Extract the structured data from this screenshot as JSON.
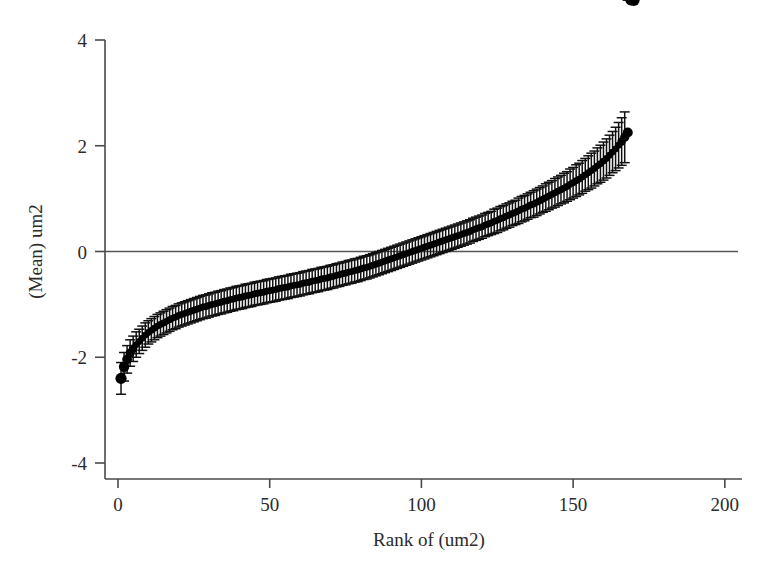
{
  "chart_data": {
    "type": "scatter",
    "title": "",
    "subtitle": "",
    "xlabel": "Rank of (um2)",
    "ylabel": "(Mean) um2",
    "xlim": [
      0,
      205
    ],
    "ylim": [
      -4,
      4
    ],
    "xticks": [
      0,
      50,
      100,
      150,
      200
    ],
    "xtick_labels": [
      "0",
      "50",
      "100",
      "150",
      "200"
    ],
    "yticks": [
      -4,
      -2,
      0,
      2,
      4
    ],
    "ytick_labels": [
      "-4",
      "-2",
      "0",
      "2",
      "4"
    ],
    "grid": false,
    "legend": null,
    "legend_position": "none",
    "reference_lines": [
      {
        "orientation": "horizontal",
        "value": 0,
        "style": "solid",
        "color": "#555555"
      }
    ],
    "marker_style": "filled-circle",
    "marker_color": "#000000",
    "error_bar_style": "capped-vertical",
    "error_bar_color": "#111111",
    "n_points": 170,
    "x": [
      1,
      2,
      3,
      4,
      5,
      6,
      7,
      8,
      9,
      10,
      11,
      12,
      13,
      14,
      15,
      16,
      17,
      18,
      19,
      20,
      21,
      22,
      23,
      24,
      25,
      26,
      27,
      28,
      29,
      30,
      31,
      32,
      33,
      34,
      35,
      36,
      37,
      38,
      39,
      40,
      41,
      42,
      43,
      44,
      45,
      46,
      47,
      48,
      49,
      50,
      51,
      52,
      53,
      54,
      55,
      56,
      57,
      58,
      59,
      60,
      61,
      62,
      63,
      64,
      65,
      66,
      67,
      68,
      69,
      70,
      71,
      72,
      73,
      74,
      75,
      76,
      77,
      78,
      79,
      80,
      81,
      82,
      83,
      84,
      85,
      86,
      87,
      88,
      89,
      90,
      91,
      92,
      93,
      94,
      95,
      96,
      97,
      98,
      99,
      100,
      101,
      102,
      103,
      104,
      105,
      106,
      107,
      108,
      109,
      110,
      111,
      112,
      113,
      114,
      115,
      116,
      117,
      118,
      119,
      120,
      121,
      122,
      123,
      124,
      125,
      126,
      127,
      128,
      129,
      130,
      131,
      132,
      133,
      134,
      135,
      136,
      137,
      138,
      139,
      140,
      141,
      142,
      143,
      144,
      145,
      146,
      147,
      148,
      149,
      150,
      151,
      152,
      153,
      154,
      155,
      156,
      157,
      158,
      159,
      160,
      161,
      162,
      163,
      164,
      165,
      166,
      167,
      168,
      169,
      170
    ],
    "y": [
      -2.4,
      -2.18,
      -2.04,
      -1.92,
      -1.84,
      -1.76,
      -1.7,
      -1.64,
      -1.58,
      -1.53,
      -1.49,
      -1.45,
      -1.41,
      -1.38,
      -1.35,
      -1.32,
      -1.29,
      -1.26,
      -1.24,
      -1.21,
      -1.19,
      -1.17,
      -1.15,
      -1.13,
      -1.11,
      -1.09,
      -1.07,
      -1.05,
      -1.04,
      -1.02,
      -1.0,
      -0.99,
      -0.97,
      -0.96,
      -0.94,
      -0.93,
      -0.91,
      -0.9,
      -0.88,
      -0.87,
      -0.86,
      -0.84,
      -0.83,
      -0.82,
      -0.8,
      -0.79,
      -0.78,
      -0.77,
      -0.75,
      -0.74,
      -0.73,
      -0.72,
      -0.7,
      -0.69,
      -0.68,
      -0.67,
      -0.65,
      -0.64,
      -0.63,
      -0.62,
      -0.6,
      -0.59,
      -0.58,
      -0.56,
      -0.55,
      -0.54,
      -0.52,
      -0.51,
      -0.5,
      -0.48,
      -0.47,
      -0.45,
      -0.44,
      -0.42,
      -0.41,
      -0.39,
      -0.38,
      -0.36,
      -0.35,
      -0.33,
      -0.31,
      -0.3,
      -0.28,
      -0.26,
      -0.24,
      -0.22,
      -0.2,
      -0.18,
      -0.16,
      -0.14,
      -0.12,
      -0.1,
      -0.08,
      -0.06,
      -0.04,
      -0.02,
      0.0,
      0.02,
      0.04,
      0.06,
      0.08,
      0.1,
      0.12,
      0.14,
      0.16,
      0.18,
      0.2,
      0.22,
      0.24,
      0.26,
      0.28,
      0.3,
      0.32,
      0.34,
      0.36,
      0.38,
      0.41,
      0.43,
      0.45,
      0.47,
      0.5,
      0.52,
      0.54,
      0.57,
      0.59,
      0.62,
      0.64,
      0.67,
      0.69,
      0.72,
      0.74,
      0.77,
      0.8,
      0.82,
      0.85,
      0.88,
      0.9,
      0.93,
      0.96,
      0.99,
      1.02,
      1.05,
      1.08,
      1.11,
      1.14,
      1.17,
      1.2,
      1.23,
      1.27,
      1.3,
      1.34,
      1.37,
      1.41,
      1.45,
      1.49,
      1.53,
      1.57,
      1.62,
      1.66,
      1.71,
      1.76,
      1.82,
      1.88,
      1.94,
      2.01,
      2.08,
      2.16,
      2.25
    ],
    "yerr": [
      0.3,
      0.27,
      0.26,
      0.25,
      0.24,
      0.24,
      0.23,
      0.23,
      0.23,
      0.22,
      0.22,
      0.22,
      0.22,
      0.22,
      0.22,
      0.22,
      0.22,
      0.22,
      0.22,
      0.22,
      0.22,
      0.22,
      0.22,
      0.22,
      0.22,
      0.22,
      0.22,
      0.22,
      0.22,
      0.22,
      0.22,
      0.22,
      0.22,
      0.22,
      0.22,
      0.22,
      0.22,
      0.22,
      0.22,
      0.22,
      0.22,
      0.22,
      0.22,
      0.22,
      0.22,
      0.22,
      0.22,
      0.22,
      0.22,
      0.22,
      0.22,
      0.22,
      0.22,
      0.22,
      0.22,
      0.22,
      0.22,
      0.22,
      0.22,
      0.22,
      0.22,
      0.22,
      0.22,
      0.22,
      0.22,
      0.22,
      0.22,
      0.22,
      0.22,
      0.22,
      0.22,
      0.22,
      0.22,
      0.22,
      0.22,
      0.22,
      0.22,
      0.22,
      0.22,
      0.22,
      0.22,
      0.22,
      0.22,
      0.22,
      0.22,
      0.22,
      0.22,
      0.22,
      0.22,
      0.22,
      0.22,
      0.22,
      0.22,
      0.22,
      0.22,
      0.22,
      0.22,
      0.22,
      0.22,
      0.22,
      0.22,
      0.22,
      0.22,
      0.22,
      0.22,
      0.22,
      0.22,
      0.22,
      0.22,
      0.22,
      0.22,
      0.22,
      0.22,
      0.22,
      0.22,
      0.22,
      0.22,
      0.22,
      0.22,
      0.22,
      0.22,
      0.22,
      0.22,
      0.23,
      0.23,
      0.23,
      0.23,
      0.23,
      0.23,
      0.23,
      0.23,
      0.24,
      0.24,
      0.24,
      0.24,
      0.24,
      0.25,
      0.25,
      0.25,
      0.25,
      0.26,
      0.26,
      0.26,
      0.27,
      0.27,
      0.27,
      0.28,
      0.28,
      0.29,
      0.29,
      0.3,
      0.3,
      0.31,
      0.31,
      0.32,
      0.33,
      0.33,
      0.34,
      0.35,
      0.36,
      0.37,
      0.38,
      0.39,
      0.41,
      0.43,
      0.45,
      0.48
    ]
  }
}
